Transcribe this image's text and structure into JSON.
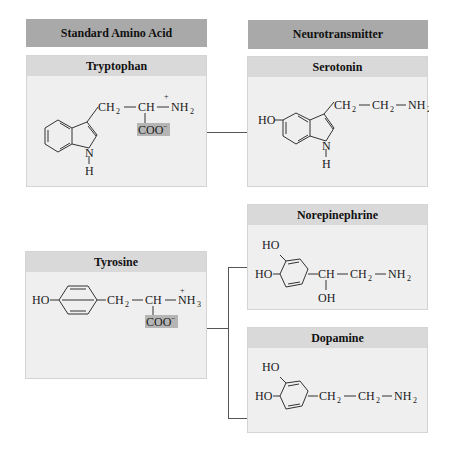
{
  "headers": {
    "left": "Standard Amino Acid",
    "right": "Neurotransmitter"
  },
  "molecules": {
    "tryptophan": {
      "name": "Tryptophan",
      "chain": [
        "CH",
        "2",
        "CH",
        "NH",
        "2"
      ],
      "charge_plus": "+",
      "carboxylate": "COO",
      "charge_minus": "−",
      "ring_n": "N",
      "ring_h": "H"
    },
    "serotonin": {
      "name": "Serotonin",
      "ho": "HO",
      "chain": [
        "CH",
        "2",
        "CH",
        "2",
        "NH",
        "2"
      ],
      "ring_n": "N",
      "ring_h": "H"
    },
    "tyrosine": {
      "name": "Tyrosine",
      "ho": "HO",
      "chain": [
        "CH",
        "2",
        "CH",
        "NH",
        "3"
      ],
      "charge_plus": "+",
      "carboxylate": "COO",
      "charge_minus": "−"
    },
    "norepinephrine": {
      "name": "Norepinephrine",
      "ho_top": "HO",
      "ho_left": "HO",
      "chain": [
        "CH",
        "CH",
        "2",
        "NH",
        "2"
      ],
      "oh": "OH"
    },
    "dopamine": {
      "name": "Dopamine",
      "ho_top": "HO",
      "ho_left": "HO",
      "chain": [
        "CH",
        "2",
        "CH",
        "2",
        "NH",
        "2"
      ]
    }
  },
  "colors": {
    "header_bg": "#a9a9a9",
    "box_bg": "#efefef",
    "title_bg": "#d9d9d9",
    "coo_highlight": "#b5b5b5"
  }
}
